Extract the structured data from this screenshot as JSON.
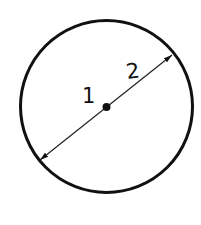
{
  "diagram": {
    "title": "",
    "labels": {
      "center": "1",
      "diameter": "2"
    },
    "colors": {
      "stroke": "#111111",
      "background": "#ffffff"
    }
  }
}
